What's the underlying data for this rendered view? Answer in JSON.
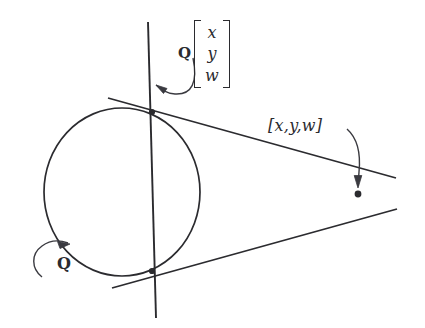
{
  "figure": {
    "background_color": "#ffffff",
    "ink_color": "#2b2b2f",
    "width": 425,
    "height": 328
  },
  "labels": {
    "conic_label": "Q",
    "polar_operator": "Q",
    "polar_vector": [
      "x",
      "y",
      "w"
    ],
    "pole_vector": "[x,y,w]"
  },
  "geometry": {
    "conic": {
      "type": "circle",
      "center": [
        122,
        192
      ],
      "radius": 78
    },
    "polar_line": {
      "from": [
        148,
        22
      ],
      "to": [
        156,
        318
      ]
    },
    "tangent_upper": {
      "from": [
        108,
        98
      ],
      "to": [
        395,
        178
      ]
    },
    "tangent_lower": {
      "from": [
        112,
        288
      ],
      "to": [
        396,
        210
      ]
    },
    "tangent_point_upper": [
      152,
      112
    ],
    "tangent_point_lower": [
      152,
      271
    ],
    "pole_point": [
      358,
      194
    ]
  },
  "annotations": {
    "arrow_to_polar": {
      "name": "arrow-to-polar-line",
      "target": [
        152,
        72
      ]
    },
    "arrow_to_pole": {
      "name": "arrow-to-pole-point",
      "target": [
        358,
        190
      ]
    },
    "arrow_to_conic": {
      "name": "arrow-to-conic",
      "target": [
        70,
        246
      ]
    }
  }
}
